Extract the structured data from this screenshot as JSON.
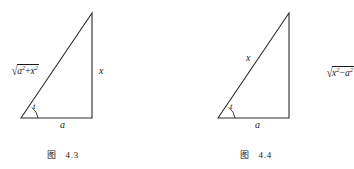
{
  "page": {
    "background_color": "#ffffff",
    "ink_color": "#1a1a1a"
  },
  "figures": [
    {
      "id": "fig-4-3",
      "caption_prefix": "图",
      "caption_number": "4.3",
      "triangle": {
        "apex": [
          92,
          13
        ],
        "bottom_left": [
          21,
          118
        ],
        "bottom_right": [
          92,
          118
        ]
      },
      "labels": {
        "hypotenuse": "√(a²+x²)",
        "hypotenuse_radicand_base1": "a",
        "hypotenuse_radicand_exp1": "2",
        "hypotenuse_operator": "+",
        "hypotenuse_radicand_base2": "x",
        "hypotenuse_radicand_exp2": "2",
        "vertical": "x",
        "base": "a",
        "angle": "t"
      }
    },
    {
      "id": "fig-4-4",
      "caption_prefix": "图",
      "caption_number": "4.4",
      "triangle": {
        "apex": [
          289,
          13
        ],
        "bottom_left": [
          218,
          118
        ],
        "bottom_right": [
          289,
          118
        ]
      },
      "labels": {
        "hypotenuse": "x",
        "vertical": "√(x²−a²)",
        "vertical_radicand_base1": "x",
        "vertical_radicand_exp1": "2",
        "vertical_operator": "−",
        "vertical_radicand_base2": "a",
        "vertical_radicand_exp2": "2",
        "base": "a",
        "angle": "t"
      }
    }
  ]
}
